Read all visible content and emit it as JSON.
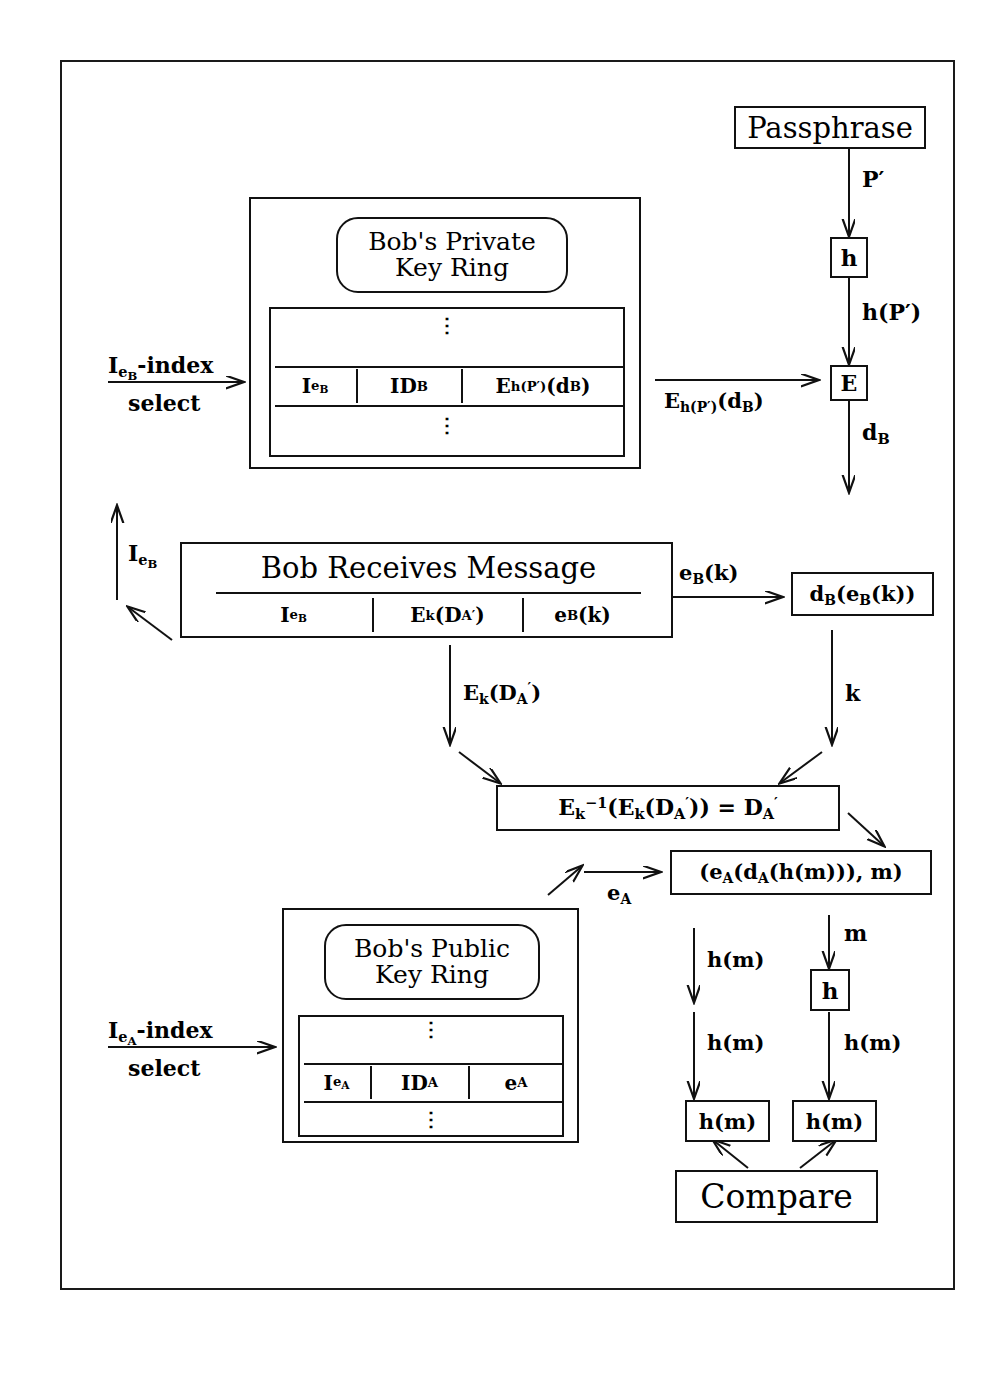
{
  "diagram": {
    "passphrase_box": "Passphrase",
    "hash_box_top": "h",
    "encrypt_box": "E",
    "private_ring": {
      "title_line1": "Bob's Private",
      "title_line2": "Key Ring",
      "columns": [
        "I",
        "ID",
        "E"
      ],
      "cell_index": "Ie_B",
      "cell_id": "ID_B",
      "cell_key": "E_h(P')(d_B)",
      "vertical_dots": "⋮"
    },
    "public_ring": {
      "title_line1": "Bob's Public",
      "title_line2": "Key Ring",
      "cell_index": "Ie_A",
      "cell_id": "ID_A",
      "cell_key": "e_A",
      "vertical_dots": "⋮"
    },
    "message_box": {
      "title": "Bob Receives Message",
      "cell_index": "Ie_B",
      "cell_payload": "E_k(D'_A)",
      "cell_sessionkey": "e_B(k)"
    },
    "boxes": {
      "decrypt_session": "d_B(e_B(k))",
      "decrypt_payload": "E_k^-1(E_k(D'_A)) = D'_A",
      "signature_pair": "(e_A(d_A(h(m))), m)",
      "hash_box_bottom": "h",
      "hash_left": "h(m)",
      "hash_right": "h(m)",
      "compare": "Compare"
    },
    "edge_labels": {
      "p_prime": "P'",
      "h_p_prime": "h(P')",
      "e_hp_db": "E_h(P')(d_B)",
      "d_b": "d_B",
      "index_select_top_line1": "Ie_B-index",
      "index_select_top_line2": "select",
      "index_select_bottom_line1": "Ie_A-index",
      "index_select_bottom_line2": "select",
      "i_eb_up": "Ie_B",
      "e_b_k": "e_B(k)",
      "e_k_da": "E_k(D'_A)",
      "k": "k",
      "e_a": "e_A",
      "m": "m",
      "h_m_left_upper": "h(m)",
      "h_m_left_lower": "h(m)",
      "h_m_right_upper": "h(m)",
      "h_m_right_lower": "h(m)"
    },
    "colors": {
      "ink": "#111111",
      "background": "#ffffff"
    }
  }
}
